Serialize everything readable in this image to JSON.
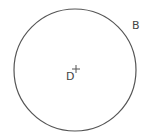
{
  "diagram": {
    "type": "geometry-figure",
    "circle": {
      "cx": 75,
      "cy": 70,
      "r": 61,
      "stroke": "#555555",
      "stroke_width": 1.2,
      "fill": "none"
    },
    "center_marker": {
      "symbol": "+",
      "x": 76,
      "y": 69,
      "size": 4,
      "stroke": "#555555"
    },
    "labels": [
      {
        "id": "D",
        "text": "D",
        "role": "center point label"
      },
      {
        "id": "B",
        "text": "B",
        "role": "circle label"
      }
    ]
  }
}
